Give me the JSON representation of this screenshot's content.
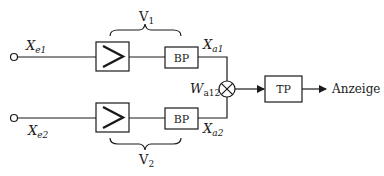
{
  "diagram": {
    "type": "block-diagram",
    "channels": [
      {
        "input_label": "X",
        "input_sub": "e1",
        "amplifier_group_label": "V",
        "amplifier_group_sub": "1",
        "filter_label": "BP",
        "output_label": "X",
        "output_sub": "a1"
      },
      {
        "input_label": "X",
        "input_sub": "e2",
        "amplifier_group_label": "V",
        "amplifier_group_sub": "2",
        "filter_label": "BP",
        "output_label": "X",
        "output_sub": "a2"
      }
    ],
    "multiplier": {
      "label": "W",
      "sub": "a12",
      "symbol": "multiplier-cross-icon"
    },
    "lowpass": {
      "label": "TP"
    },
    "output": {
      "label": "Anzeige"
    },
    "amplifier_symbol": "greater-than-amplifier-icon",
    "colors": {
      "stroke": "#1a1a1a",
      "background": "#ffffff"
    }
  }
}
